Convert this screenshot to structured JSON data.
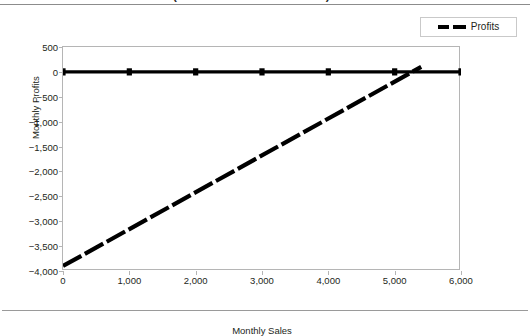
{
  "header": {
    "running_title": "FIGURE 7-5  THE BREAKEVEN (IN THOUSANDS OF UNITS)"
  },
  "legend": {
    "position": "top-right",
    "entries": [
      {
        "label": "Profits",
        "color": "#000000",
        "style": "dashed"
      }
    ]
  },
  "chart_data": {
    "type": "line",
    "title": "",
    "xlabel": "Monthly Sales",
    "ylabel": "Monthly Profits",
    "xlim": [
      0,
      6000
    ],
    "ylim": [
      -4000,
      500
    ],
    "xticks": [
      "0",
      "1,000",
      "2,000",
      "3,000",
      "4,000",
      "5,000",
      "6,000"
    ],
    "xtick_values": [
      0,
      1000,
      2000,
      3000,
      4000,
      5000,
      6000
    ],
    "yticks": [
      "500",
      "0",
      "−500",
      "−1,000",
      "−1,500",
      "−2,000",
      "−2,500",
      "−3,000",
      "−3,500",
      "−4,000"
    ],
    "ytick_values": [
      500,
      0,
      -500,
      -1000,
      -1500,
      -2000,
      -2500,
      -3000,
      -3500,
      -4000
    ],
    "grid": false,
    "series": [
      {
        "name": "Breakeven",
        "color": "#000000",
        "style": "solid",
        "marker": "square",
        "x": [
          0,
          1000,
          2000,
          3000,
          4000,
          5000,
          6000
        ],
        "values": [
          0,
          0,
          0,
          0,
          0,
          0,
          0
        ]
      },
      {
        "name": "Profits",
        "color": "#000000",
        "style": "dashed",
        "marker": "none",
        "x": [
          0,
          5400
        ],
        "values": [
          -3900,
          100
        ]
      }
    ],
    "annotations": [
      {
        "text": "breakeven crossing",
        "x": 5150,
        "y": 0
      }
    ]
  }
}
